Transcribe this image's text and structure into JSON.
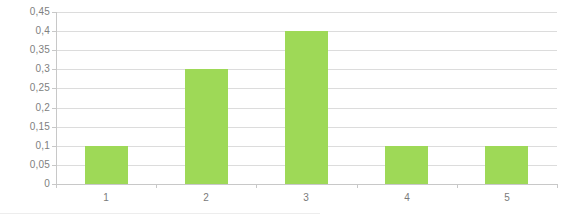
{
  "chart_data": {
    "type": "bar",
    "title": "",
    "subtitle": "",
    "xlabel": "",
    "ylabel": "",
    "categories": [
      "1",
      "2",
      "3",
      "4",
      "5"
    ],
    "values": [
      0.1,
      0.3,
      0.4,
      0.1,
      0.1
    ],
    "series": [
      {
        "name": "",
        "values": [
          0.1,
          0.3,
          0.4,
          0.1,
          0.1
        ]
      }
    ],
    "ylim": [
      0,
      0.45
    ],
    "ytick_values": [
      0,
      0.05,
      0.1,
      0.15,
      0.2,
      0.25,
      0.3,
      0.35,
      0.4,
      0.45
    ],
    "ytick_labels": [
      "0",
      "0,05",
      "0,1",
      "0,15",
      "0,2",
      "0,25",
      "0,3",
      "0,35",
      "0,4",
      "0,45"
    ],
    "decimal_separator": ",",
    "grid": true,
    "grid_axis": "y",
    "legend": false,
    "legend_position": "none",
    "bar_color": "#9ed957",
    "grid_color": "#dcdcdc",
    "axis_color": "#c8c8c8",
    "tick_label_color": "#808080",
    "background_color": "#ffffff",
    "annotations": []
  }
}
